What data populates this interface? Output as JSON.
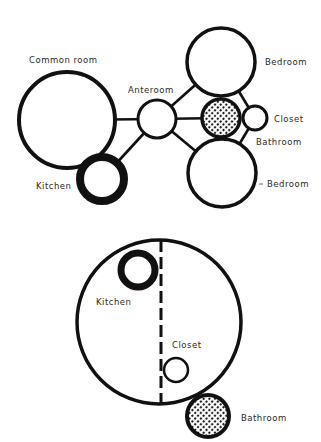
{
  "colors": {
    "background": "#ffffff",
    "stroke": "#111111",
    "hatch_dot": "#111111"
  },
  "top_diagram": {
    "nodes": [
      {
        "id": "common_room",
        "label": "Common room",
        "cx": 67,
        "cy": 120,
        "r": 48,
        "stroke": 4,
        "fill": "plain"
      },
      {
        "id": "kitchen",
        "label": "Kitchen",
        "cx": 102,
        "cy": 179,
        "r": 22,
        "stroke": 8,
        "fill": "plain"
      },
      {
        "id": "anteroom",
        "label": "Anteroom",
        "cx": 157,
        "cy": 119,
        "r": 19,
        "stroke": 3,
        "fill": "plain"
      },
      {
        "id": "bedroom_top",
        "label": "Bedroom",
        "cx": 221,
        "cy": 62,
        "r": 34,
        "stroke": 3.5,
        "fill": "plain"
      },
      {
        "id": "bathroom",
        "label": "Bathroom",
        "cx": 221,
        "cy": 118,
        "r": 19,
        "stroke": 3.5,
        "fill": "dotted"
      },
      {
        "id": "closet",
        "label": "Closet",
        "cx": 255,
        "cy": 118,
        "r": 12,
        "stroke": 3,
        "fill": "plain"
      },
      {
        "id": "bedroom_bottom",
        "label": "Bedroom",
        "cx": 222,
        "cy": 173,
        "r": 34,
        "stroke": 3.5,
        "fill": "plain"
      }
    ],
    "edges": [
      [
        "common_room",
        "anteroom"
      ],
      [
        "anteroom",
        "kitchen"
      ],
      [
        "anteroom",
        "bedroom_top"
      ],
      [
        "anteroom",
        "bathroom"
      ],
      [
        "anteroom",
        "bedroom_bottom"
      ],
      [
        "bedroom_top",
        "closet"
      ],
      [
        "closet",
        "bedroom_bottom"
      ]
    ],
    "labels": {
      "common_room": {
        "text": "Common room",
        "x": 29,
        "y": 56
      },
      "anteroom": {
        "text": "Anteroom",
        "x": 128,
        "y": 86
      },
      "bedroom_top": {
        "text": "Bedroom",
        "x": 265,
        "y": 58
      },
      "closet": {
        "text": "Closet",
        "x": 274,
        "y": 115
      },
      "bathroom": {
        "text": "Bathroom",
        "x": 256,
        "y": 138
      },
      "bedroom_bottom": {
        "text": "Bedroom",
        "x": 267,
        "y": 180
      },
      "kitchen": {
        "text": "Kitchen",
        "x": 36,
        "y": 182
      }
    }
  },
  "bottom_diagram": {
    "nodes": [
      {
        "id": "dwelling",
        "label": "",
        "cx": 159,
        "cy": 322,
        "r": 82,
        "stroke": 3.5,
        "fill": "plain"
      },
      {
        "id": "kitchen",
        "label": "Kitchen",
        "cx": 138,
        "cy": 270,
        "r": 17,
        "stroke": 7,
        "fill": "plain"
      },
      {
        "id": "closet",
        "label": "Closet",
        "cx": 176,
        "cy": 370,
        "r": 12,
        "stroke": 2.5,
        "fill": "plain"
      },
      {
        "id": "bathroom",
        "label": "Bathroom",
        "cx": 208,
        "cy": 416,
        "r": 21,
        "stroke": 4,
        "fill": "dotted"
      }
    ],
    "divider": {
      "x": 161,
      "y1": 240,
      "y2": 406,
      "dash": 12,
      "gap": 5,
      "stroke": 3
    },
    "labels": {
      "kitchen": {
        "text": "Kitchen",
        "x": 96,
        "y": 298
      },
      "closet": {
        "text": "Closet",
        "x": 172,
        "y": 341
      },
      "bathroom": {
        "text": "Bathroom",
        "x": 241,
        "y": 414
      }
    }
  }
}
